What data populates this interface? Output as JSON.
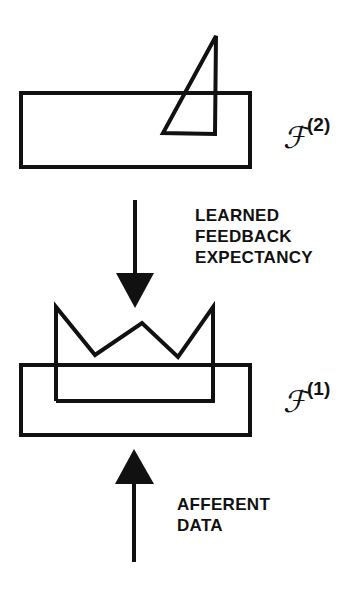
{
  "diagram": {
    "levels": [
      {
        "id": "F2",
        "symbol": "ℱ",
        "superscript": "(2)"
      },
      {
        "id": "F1",
        "symbol": "ℱ",
        "superscript": "(1)"
      }
    ],
    "feedback_label": {
      "line1": "LEARNED",
      "line2": "FEEDBACK",
      "line3": "EXPECTANCY"
    },
    "afferent_label": {
      "line1": "AFFERENT",
      "line2": "DATA"
    },
    "colors": {
      "stroke": "#111111",
      "background": "#ffffff"
    }
  }
}
